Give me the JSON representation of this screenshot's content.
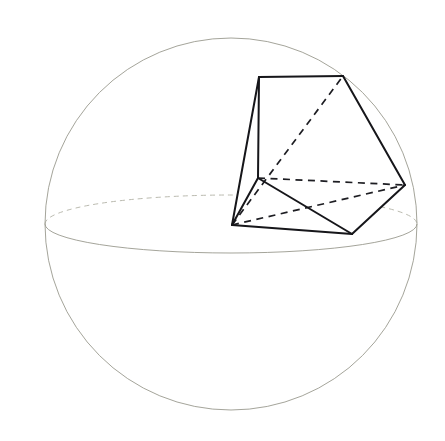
{
  "figure": {
    "caption": "",
    "background_color": "#ffffff",
    "width": 445,
    "height": 441
  },
  "colors": {
    "sphere_outline": "#9a9a8e",
    "sphere_hidden": "#b2b2a6",
    "polyhedron_visible_edge": "#16161a",
    "polyhedron_hidden_edge": "#1d1d22",
    "face_fill": "#ffffff"
  },
  "sphere": {
    "name": "circumscribing-sphere",
    "center_x": 231,
    "center_y": 224,
    "radius": 186,
    "equator": {
      "name": "equator-ellipse",
      "rx": 186,
      "ry": 29,
      "front_arc_style": "solid",
      "back_arc_style": "dashed"
    }
  },
  "polyhedron": {
    "name": "inscribed-polyhedron",
    "vertex_count": 6,
    "vertices": [
      {
        "id": "A",
        "label": "top-left-vertex",
        "x": 259,
        "y": 77
      },
      {
        "id": "B",
        "label": "top-right-vertex",
        "x": 343,
        "y": 76
      },
      {
        "id": "C",
        "label": "right-vertex",
        "x": 405,
        "y": 185
      },
      {
        "id": "D",
        "label": "bottom-right-vertex",
        "x": 352,
        "y": 234
      },
      {
        "id": "E",
        "label": "bottom-left-apex",
        "x": 232,
        "y": 225
      },
      {
        "id": "F",
        "label": "middle-junction",
        "x": 258,
        "y": 178
      }
    ],
    "visible_edges": [
      {
        "from": "A",
        "to": "B"
      },
      {
        "from": "B",
        "to": "C"
      },
      {
        "from": "C",
        "to": "D"
      },
      {
        "from": "D",
        "to": "E"
      },
      {
        "from": "E",
        "to": "A"
      },
      {
        "from": "A",
        "to": "F"
      },
      {
        "from": "F",
        "to": "E"
      },
      {
        "from": "F",
        "to": "D"
      }
    ],
    "hidden_edges": [
      {
        "from": "E",
        "to": "B"
      },
      {
        "from": "E",
        "to": "C"
      },
      {
        "from": "F",
        "to": "C"
      }
    ],
    "faces": [
      {
        "name": "front-upper-face",
        "vertices": [
          "A",
          "B",
          "C",
          "D",
          "F"
        ]
      },
      {
        "name": "front-lower-face",
        "vertices": [
          "E",
          "F",
          "D"
        ]
      },
      {
        "name": "left-face",
        "vertices": [
          "A",
          "F",
          "E"
        ]
      }
    ]
  }
}
